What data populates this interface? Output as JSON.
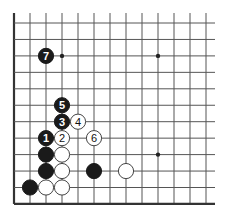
{
  "board": {
    "cols": 13,
    "rows": 12,
    "edges": {
      "left": true,
      "bottom": true,
      "top": false,
      "right": false
    },
    "star_points": [
      {
        "col": 3,
        "row": 2
      },
      {
        "col": 9,
        "row": 2
      },
      {
        "col": 9,
        "row": 8
      }
    ],
    "stones": [
      {
        "color": "black",
        "col": 2,
        "row": 2,
        "label": "7"
      },
      {
        "color": "black",
        "col": 3,
        "row": 5,
        "label": "5"
      },
      {
        "color": "black",
        "col": 3,
        "row": 6,
        "label": "3"
      },
      {
        "color": "white",
        "col": 4,
        "row": 6,
        "label": "4"
      },
      {
        "color": "black",
        "col": 2,
        "row": 7,
        "label": "1"
      },
      {
        "color": "white",
        "col": 3,
        "row": 7,
        "label": "2"
      },
      {
        "color": "white",
        "col": 5,
        "row": 7,
        "label": "6"
      },
      {
        "color": "black",
        "col": 2,
        "row": 8,
        "label": ""
      },
      {
        "color": "white",
        "col": 3,
        "row": 8,
        "label": ""
      },
      {
        "color": "black",
        "col": 2,
        "row": 9,
        "label": ""
      },
      {
        "color": "white",
        "col": 3,
        "row": 9,
        "label": ""
      },
      {
        "color": "black",
        "col": 5,
        "row": 9,
        "label": ""
      },
      {
        "color": "white",
        "col": 7,
        "row": 9,
        "label": ""
      },
      {
        "color": "black",
        "col": 1,
        "row": 10,
        "label": ""
      },
      {
        "color": "white",
        "col": 2,
        "row": 10,
        "label": ""
      },
      {
        "color": "white",
        "col": 3,
        "row": 10,
        "label": ""
      }
    ]
  },
  "colors": {
    "black_stone": "#1a1a1a",
    "white_stone": "#ffffff",
    "grid": "#555555"
  }
}
